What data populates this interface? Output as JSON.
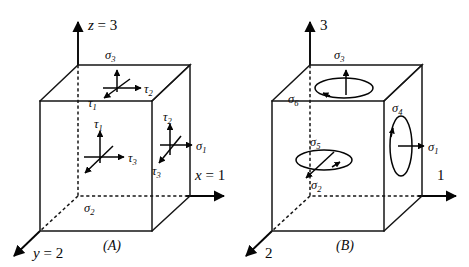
{
  "figure": {
    "background_color": "#ffffff",
    "line_color": "#161616",
    "panels": [
      {
        "id": "A",
        "caption": "(A)",
        "axes": [
          {
            "name": "z-axis",
            "label": "z = 3",
            "direction": "up"
          },
          {
            "name": "x-axis",
            "label": "x = 1",
            "direction": "right"
          },
          {
            "name": "y-axis",
            "label": "y = 2",
            "direction": "down-left"
          }
        ],
        "faces": [
          {
            "name": "top-face",
            "normal_stress": "σ₃",
            "shear_stresses": [
              "τ₂",
              "τ₁"
            ]
          },
          {
            "name": "front-face",
            "normal_stress": "σ₂",
            "shear_stresses": [
              "τ₁",
              "τ₃"
            ]
          },
          {
            "name": "right-face",
            "normal_stress": "σ₁",
            "shear_stresses": [
              "τ₂",
              "τ₃"
            ]
          }
        ],
        "labels": {
          "sigma_3": "σ",
          "sigma_3_sub": "3",
          "sigma_2": "σ",
          "sigma_2_sub": "2",
          "sigma_1": "σ",
          "sigma_1_sub": "1",
          "tau_top_right": "τ",
          "tau_top_right_sub": "2",
          "tau_top_left": "τ",
          "tau_top_left_sub": "1",
          "tau_front_up": "τ",
          "tau_front_up_sub": "1",
          "tau_front_right": "τ",
          "tau_front_right_sub": "3",
          "tau_right_up": "τ",
          "tau_right_up_sub": "2",
          "tau_right_low": "τ",
          "tau_right_low_sub": "3",
          "axis_z": "z",
          "axis_z_value": " = 3",
          "axis_x": "x",
          "axis_x_value": " = 1",
          "axis_y": "y",
          "axis_y_value": " = 2"
        }
      },
      {
        "id": "B",
        "caption": "(B)",
        "axes": [
          {
            "name": "axis-3",
            "label": "3",
            "direction": "up"
          },
          {
            "name": "axis-1",
            "label": "1",
            "direction": "right"
          },
          {
            "name": "axis-2",
            "label": "2",
            "direction": "down-left"
          }
        ],
        "faces": [
          {
            "name": "top-face",
            "normal_stress": "σ₃",
            "shear_loop": "σ₆"
          },
          {
            "name": "front-face",
            "normal_stress": "σ₂",
            "shear_loop": "σ₅"
          },
          {
            "name": "right-face",
            "normal_stress": "σ₁",
            "shear_loop": "σ₄"
          }
        ],
        "labels": {
          "sigma_3": "σ",
          "sigma_3_sub": "3",
          "sigma_6": "σ",
          "sigma_6_sub": "6",
          "sigma_5": "σ",
          "sigma_5_sub": "5",
          "sigma_2": "σ",
          "sigma_2_sub": "2",
          "sigma_4": "σ",
          "sigma_4_sub": "4",
          "sigma_1": "σ",
          "sigma_1_sub": "1",
          "axis_3": "3",
          "axis_1": "1",
          "axis_2": "2"
        }
      }
    ]
  }
}
